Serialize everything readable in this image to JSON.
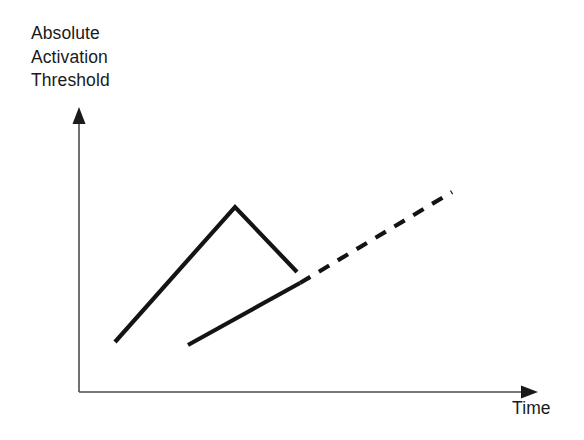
{
  "figure": {
    "background_color": "#ffffff",
    "width": 584,
    "height": 440
  },
  "axes": {
    "y_title": "Absolute\nActivation\nThreshold",
    "x_title": "Time",
    "axis_color": "#4d4d4d",
    "arrow_color": "#1a1a1a"
  },
  "chart_data": {
    "type": "line",
    "title": "",
    "subtitle": "",
    "xlabel": "Time",
    "ylabel": "Absolute Activation Threshold",
    "xlim": [
      0,
      100
    ],
    "ylim": [
      0,
      100
    ],
    "grid": false,
    "legend": "none",
    "axis_ticks": {
      "x": [],
      "y": []
    },
    "annotations": [],
    "series": [
      {
        "name": "Untrained threshold course",
        "style": "solid",
        "color": "#141414",
        "linewidth": 4,
        "points": [
          {
            "x": 7.9,
            "y": 17.6
          },
          {
            "x": 34.1,
            "y": 65.1
          },
          {
            "x": 47.6,
            "y": 42.3
          }
        ]
      },
      {
        "name": "Trained threshold course",
        "style": "solid",
        "color": "#141414",
        "linewidth": 4,
        "points": [
          {
            "x": 23.8,
            "y": 16.5
          },
          {
            "x": 48.3,
            "y": 38.4
          }
        ]
      },
      {
        "name": "Projected threshold course",
        "style": "dashed",
        "color": "#141414",
        "linewidth": 4,
        "dash_length": 12,
        "gap_length": 10,
        "points": [
          {
            "x": 48.3,
            "y": 38.4
          },
          {
            "x": 81.4,
            "y": 70.4
          }
        ]
      }
    ]
  },
  "geometry": {
    "y_axis": {
      "x": 79,
      "y_bottom": 392,
      "y_top": 110,
      "arrow_tip_y": 107
    },
    "x_axis": {
      "y": 392,
      "x_left": 79,
      "x_right": 530,
      "arrow_tip_x": 538
    },
    "peak_line": "115,342 235,207 297,272",
    "lower_line": "188,345 300,283",
    "dashed_line": "300,283 452,192"
  }
}
